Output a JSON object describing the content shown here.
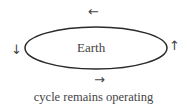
{
  "diagram": {
    "center_label": "Earth",
    "caption": "cycle remains operating",
    "arrows": {
      "top": "←",
      "bottom": "→",
      "left": "↓",
      "right": "↑"
    },
    "colors": {
      "stroke": "#2a2a2a",
      "text": "#444444"
    }
  }
}
